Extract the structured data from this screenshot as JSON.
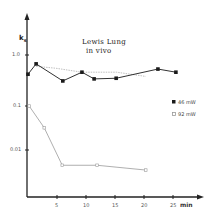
{
  "chart_data": {
    "type": "line",
    "title": "Lewis Lung in vivo",
    "title_lines": [
      "Lewis Lung",
      "in vivo"
    ],
    "xlabel": "min",
    "ylabel": "k_s",
    "yscale": "log",
    "xlim": [
      0,
      27
    ],
    "ylim": [
      0.002,
      2
    ],
    "x_ticks": [
      "5",
      "10",
      "15",
      "20",
      "25"
    ],
    "y_ticks": [
      "1.0",
      "0.1",
      "0.01"
    ],
    "grid": false,
    "legend_position": "right",
    "series": [
      {
        "name": "46 mW",
        "marker": "filled-square",
        "color": "#1a1a1a",
        "x": [
          0,
          1.4,
          6,
          9.3,
          11.4,
          15.2,
          22.4,
          25.5
        ],
        "y": [
          0.42,
          0.67,
          0.31,
          0.46,
          0.34,
          0.35,
          0.53,
          0.46
        ]
      },
      {
        "name": "92 mW",
        "marker": "open-square",
        "color": "#9a9a9a",
        "x": [
          0.2,
          2.8,
          5.9,
          11.9,
          20.3
        ],
        "y": [
          0.1,
          0.032,
          0.0045,
          0.0045,
          0.0035
        ]
      },
      {
        "name": "",
        "marker": "none",
        "color": "#b0b0b0",
        "x": [
          1.4,
          4.8,
          9.3,
          15.3,
          20.3
        ],
        "y": [
          0.6,
          0.55,
          0.46,
          0.46,
          0.38
        ]
      }
    ]
  },
  "labels": {
    "title_line1": "Lewis Lung",
    "title_line2": "in vivo",
    "ylabel": "k",
    "ylabel_sub": "s",
    "xunit": "min",
    "ytick_1": "1.0",
    "ytick_01": "0.1",
    "ytick_001": "0.01",
    "xtick_5": "5",
    "xtick_10": "10",
    "xtick_15": "15",
    "xtick_20": "20",
    "xtick_25": "25",
    "legend_46": "46 mW",
    "legend_92": "92 mW"
  }
}
